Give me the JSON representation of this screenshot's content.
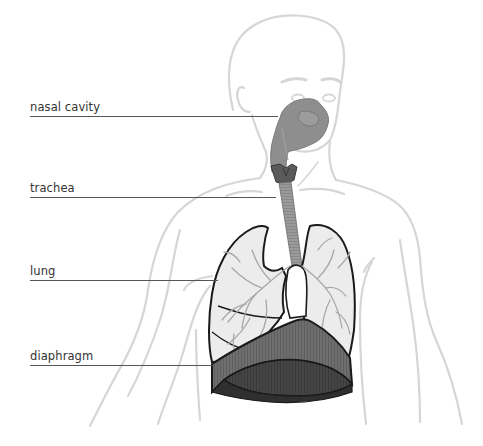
{
  "diagram": {
    "labels": [
      {
        "id": "nasal-cavity",
        "text": "nasal cavity",
        "x": 30,
        "y": 100,
        "line_y": 116,
        "line_x1": 30,
        "line_x2": 278
      },
      {
        "id": "trachea",
        "text": "trachea",
        "x": 30,
        "y": 181,
        "line_y": 197,
        "line_x1": 30,
        "line_x2": 276
      },
      {
        "id": "lung",
        "text": "lung",
        "x": 30,
        "y": 264,
        "line_y": 280,
        "line_x1": 30,
        "line_x2": 218
      },
      {
        "id": "diaphragm",
        "text": "diaphragm",
        "x": 30,
        "y": 349,
        "line_y": 365,
        "line_x1": 30,
        "line_x2": 214
      }
    ],
    "colors": {
      "body_outline": "#d4d4d4",
      "lung_fill": "#ececec",
      "lung_outline": "#1a1a1a",
      "bronchi": "#a8a8a8",
      "airway": "#8e8e8e",
      "larynx": "#5a5a5a",
      "diaphragm_light": "#6e6e6e",
      "diaphragm_dark": "#3a3a3a",
      "leader_line": "#555555",
      "label_text": "#333333"
    }
  }
}
